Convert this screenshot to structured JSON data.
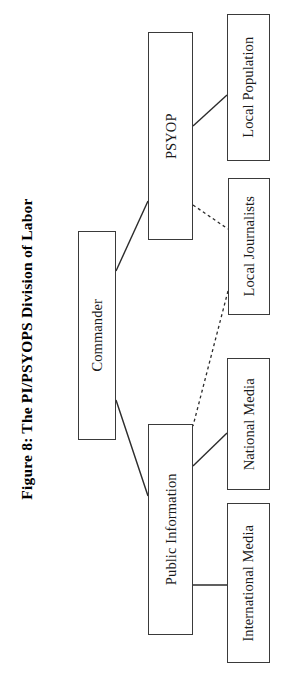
{
  "figure": {
    "title": "Figure 8: The PI/PSYOPS Division of Labor",
    "orientation": "rotated-90-ccw",
    "canvas": {
      "width": 286,
      "height": 697
    },
    "colors": {
      "background": "#ffffff",
      "box_border": "#3a3a3a",
      "connector": "#2b2b2b",
      "text": "#1a1a1a",
      "title_text": "#000000"
    }
  },
  "nodes": [
    {
      "id": "commander",
      "label": "Commander",
      "x": 78,
      "y": 231,
      "width": 38,
      "height": 209
    },
    {
      "id": "psyop",
      "label": "PSYOP",
      "x": 148,
      "y": 32,
      "width": 45,
      "height": 208
    },
    {
      "id": "public-information",
      "label": "Public Information",
      "x": 148,
      "y": 424,
      "width": 45,
      "height": 211
    },
    {
      "id": "local-population",
      "label": "Local Population",
      "x": 227,
      "y": 14,
      "width": 43,
      "height": 147
    },
    {
      "id": "local-journalists",
      "label": "Local Journalists",
      "x": 228,
      "y": 178,
      "width": 42,
      "height": 137
    },
    {
      "id": "national-media",
      "label": "National Media",
      "x": 227,
      "y": 358,
      "width": 43,
      "height": 132
    },
    {
      "id": "international-media",
      "label": "International Media",
      "x": 227,
      "y": 503,
      "width": 43,
      "height": 160
    }
  ],
  "connectors": [
    {
      "id": "commander-to-psyop",
      "from": "commander",
      "to": "psyop",
      "style": "solid",
      "x1": 116,
      "y1": 271,
      "x2": 148,
      "y2": 201
    },
    {
      "id": "commander-to-public-information",
      "from": "commander",
      "to": "public-information",
      "style": "solid",
      "x1": 116,
      "y1": 400,
      "x2": 148,
      "y2": 496
    },
    {
      "id": "psyop-to-local-population",
      "from": "psyop",
      "to": "local-population",
      "style": "solid",
      "x1": 193,
      "y1": 126,
      "x2": 227,
      "y2": 95
    },
    {
      "id": "psyop-to-local-journalists",
      "from": "psyop",
      "to": "local-journalists",
      "style": "dashed",
      "x1": 193,
      "y1": 205,
      "x2": 228,
      "y2": 229
    },
    {
      "id": "local-journalists-to-public-information",
      "from": "local-journalists",
      "to": "public-information",
      "style": "dashed",
      "x1": 228,
      "y1": 291,
      "x2": 193,
      "y2": 426
    },
    {
      "id": "public-information-to-national-media",
      "from": "public-information",
      "to": "national-media",
      "style": "solid",
      "x1": 193,
      "y1": 466,
      "x2": 227,
      "y2": 433
    },
    {
      "id": "public-information-to-international-media",
      "from": "public-information",
      "to": "international-media",
      "style": "solid",
      "x1": 193,
      "y1": 585,
      "x2": 227,
      "y2": 585
    }
  ]
}
